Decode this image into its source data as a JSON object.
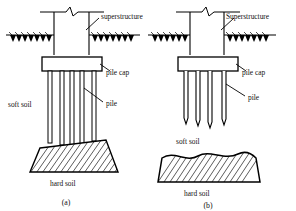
{
  "figure": {
    "title_present": false,
    "panels": [
      {
        "id": "a",
        "caption": "(a)",
        "type": "end-bearing-pile-foundation",
        "labels": {
          "superstructure": "superstructure",
          "pile_cap": "pile cap",
          "pile": "pile",
          "soft_soil": "soft soil",
          "hard_soil": "hard soil"
        },
        "pile_count": 5,
        "pile_tip": "flat",
        "piles_reach_hard_soil": true
      },
      {
        "id": "b",
        "caption": "(b)",
        "type": "floating-friction-pile-foundation",
        "labels": {
          "superstructure": "Superstructure",
          "pile_cap": "pile cap",
          "pile": "pile",
          "soft_soil": "soft soil",
          "hard_soil": "hard soil"
        },
        "pile_count": 4,
        "pile_tip": "pointed",
        "piles_reach_hard_soil": false
      }
    ],
    "colors": {
      "line": "#000000",
      "fill": "#ffffff",
      "ground_fill": "#000000",
      "background": "#ffffff"
    }
  }
}
